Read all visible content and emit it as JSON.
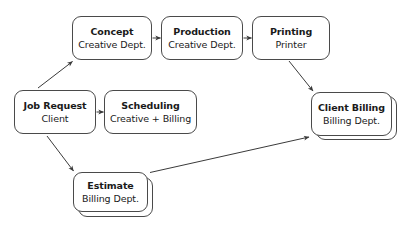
{
  "diagram": {
    "background_color": "#ffffff",
    "node_border_color": "#4a4a4a",
    "edge_color": "#3a3a3a",
    "text_color": "#1a1a1a",
    "nodes": [
      {
        "id": "job-request",
        "title": "Job Request",
        "subtitle": "Client",
        "stacked": false,
        "x": 14,
        "y": 90,
        "w": 82,
        "h": 44
      },
      {
        "id": "concept",
        "title": "Concept",
        "subtitle": "Creative Dept.",
        "stacked": false,
        "x": 72,
        "y": 16,
        "w": 80,
        "h": 44
      },
      {
        "id": "production",
        "title": "Production",
        "subtitle": "Creative Dept.",
        "stacked": false,
        "x": 161,
        "y": 16,
        "w": 82,
        "h": 44
      },
      {
        "id": "printing",
        "title": "Printing",
        "subtitle": "Printer",
        "stacked": false,
        "x": 252,
        "y": 16,
        "w": 78,
        "h": 44
      },
      {
        "id": "scheduling",
        "title": "Scheduling",
        "subtitle": "Creative + Billing",
        "stacked": false,
        "x": 104,
        "y": 90,
        "w": 93,
        "h": 44
      },
      {
        "id": "client-billing",
        "title": "Client Billing",
        "subtitle": "Billing Dept.",
        "stacked": true,
        "x": 311,
        "y": 92,
        "w": 81,
        "h": 44
      },
      {
        "id": "estimate",
        "title": "Estimate",
        "subtitle": "Billing Dept.",
        "stacked": true,
        "x": 73,
        "y": 172,
        "w": 75,
        "h": 40
      }
    ],
    "edges": [
      {
        "id": "job-request-to-concept",
        "from": "job-request",
        "to": "concept",
        "style": "diagonal-up"
      },
      {
        "id": "job-request-to-scheduling",
        "from": "job-request",
        "to": "scheduling",
        "style": "horizontal"
      },
      {
        "id": "job-request-to-estimate",
        "from": "job-request",
        "to": "estimate",
        "style": "diagonal-down"
      },
      {
        "id": "concept-to-production",
        "from": "concept",
        "to": "production",
        "style": "horizontal"
      },
      {
        "id": "production-to-printing",
        "from": "production",
        "to": "printing",
        "style": "horizontal"
      },
      {
        "id": "printing-to-client-billing",
        "from": "printing",
        "to": "client-billing",
        "style": "diagonal-down"
      },
      {
        "id": "estimate-to-client-billing",
        "from": "estimate",
        "to": "client-billing",
        "style": "diagonal-up-long"
      }
    ]
  }
}
